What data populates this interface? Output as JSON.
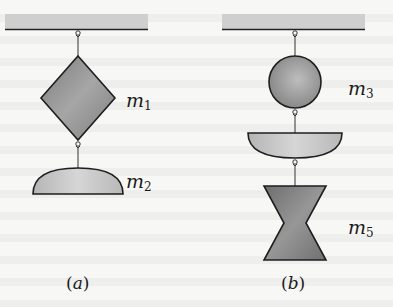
{
  "figure": {
    "panels": [
      {
        "id": "a",
        "caption_letter": "a",
        "objects": [
          {
            "shape": "square-diamond",
            "label_base": "m",
            "label_sub": "1"
          },
          {
            "shape": "half-disk-dome",
            "label_base": "m",
            "label_sub": "2"
          }
        ]
      },
      {
        "id": "b",
        "caption_letter": "b",
        "objects": [
          {
            "shape": "sphere",
            "label_base": "m",
            "label_sub": "3"
          },
          {
            "shape": "half-disk-bowl",
            "label_base": "",
            "label_sub": ""
          },
          {
            "shape": "hourglass",
            "label_base": "m",
            "label_sub": "5"
          }
        ]
      }
    ],
    "colors": {
      "ceiling_fill": "#cfcfcf",
      "ceiling_line": "#222222",
      "object_fill_dark": "#8f8f8f",
      "object_fill_mid": "#a9a9a9",
      "object_fill_light": "#d2d2d2",
      "outline": "#1e1e1e",
      "string": "#333333"
    }
  }
}
